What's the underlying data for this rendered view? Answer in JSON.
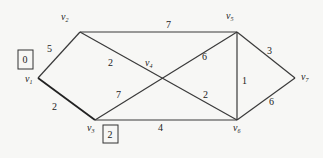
{
  "graph": {
    "vertices": [
      {
        "id": "v1",
        "label": "v",
        "sub": "1",
        "x": 38,
        "y": 78,
        "lx": 25,
        "ly": 82
      },
      {
        "id": "v2",
        "label": "v",
        "sub": "2",
        "x": 80,
        "y": 32,
        "lx": 61,
        "ly": 20
      },
      {
        "id": "v3",
        "label": "v",
        "sub": "3",
        "x": 95,
        "y": 120,
        "lx": 87,
        "ly": 131
      },
      {
        "id": "v4",
        "label": "v",
        "sub": "4",
        "x": 162,
        "y": 85,
        "lx": 145,
        "ly": 66
      },
      {
        "id": "v5",
        "label": "v",
        "sub": "5",
        "x": 237,
        "y": 32,
        "lx": 226,
        "ly": 19
      },
      {
        "id": "v6",
        "label": "v",
        "sub": "6",
        "x": 237,
        "y": 120,
        "lx": 233,
        "ly": 131
      },
      {
        "id": "v7",
        "label": "v",
        "sub": "7",
        "x": 295,
        "y": 78,
        "lx": 301,
        "ly": 80
      }
    ],
    "edges": [
      {
        "from": "v1",
        "to": "v2",
        "weight": "5",
        "wx": 47,
        "wy": 52
      },
      {
        "from": "v2",
        "to": "v5",
        "weight": "7",
        "wx": 166,
        "wy": 28
      },
      {
        "from": "v2",
        "to": "v6",
        "weight": "2",
        "wx": 108,
        "wy": 66,
        "weight2": "2",
        "w2x": 203,
        "w2y": 98
      },
      {
        "from": "v1",
        "to": "v3",
        "weight": "2",
        "wx": 52,
        "wy": 110
      },
      {
        "from": "v3",
        "to": "v5",
        "weight": "7",
        "wx": 116,
        "wy": 98,
        "weight2": "6",
        "w2x": 202,
        "w2y": 60
      },
      {
        "from": "v3",
        "to": "v6",
        "weight": "4",
        "wx": 158,
        "wy": 131
      },
      {
        "from": "v5",
        "to": "v6",
        "weight": "1",
        "wx": 242,
        "wy": 84
      },
      {
        "from": "v5",
        "to": "v7",
        "weight": "3",
        "wx": 267,
        "wy": 54
      },
      {
        "from": "v7",
        "to": "v6",
        "weight": "6",
        "wx": 269,
        "wy": 105
      }
    ],
    "boxes": [
      {
        "vertex": "v1",
        "value": "0",
        "x": 18,
        "y": 50,
        "w": 15,
        "h": 19
      },
      {
        "vertex": "v3",
        "value": "2",
        "x": 103,
        "y": 125,
        "w": 15,
        "h": 18
      }
    ]
  }
}
